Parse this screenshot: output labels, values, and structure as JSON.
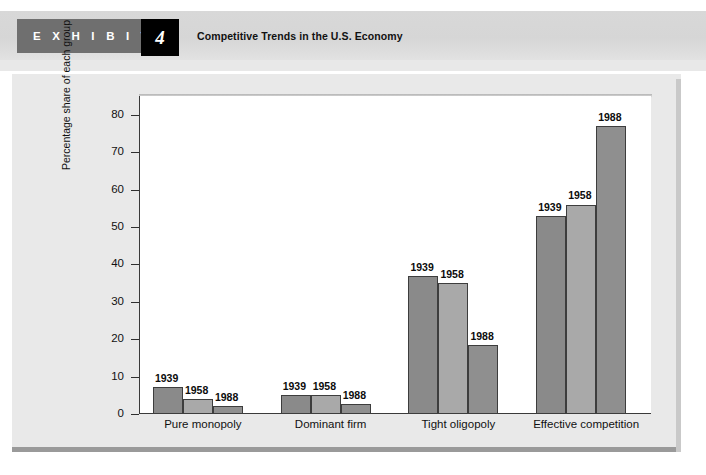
{
  "exhibit": {
    "kicker": "E X H I B I T",
    "number": "4",
    "title": "Competitive Trends in the U.S. Economy"
  },
  "colors": {
    "bar_1939": "#8a8a8a",
    "bar_1958": "#a9a9a9",
    "bar_1988": "#8f8f8f",
    "bar_border": "#3d3d3d",
    "panel_bg": "#e9e9e9",
    "plot_bg": "#ffffff",
    "axis": "#2f2f2f",
    "header_band": "#d6d6d6",
    "exhibit_tab": "#6f6f6f",
    "exhibit_num_bg": "#000000"
  },
  "chart_data": {
    "type": "bar",
    "title": "Competitive Trends in the U.S. Economy",
    "xlabel": "",
    "ylabel": "Percentage share of each group",
    "ylim": [
      0,
      85
    ],
    "yticks": [
      0,
      10,
      20,
      30,
      40,
      50,
      60,
      70,
      80
    ],
    "ytick_labels": [
      "0",
      "10",
      "20",
      "30",
      "40",
      "50",
      "60",
      "70",
      "80"
    ],
    "grid": false,
    "legend": "none",
    "data_labels": true,
    "categories": [
      "Pure monopoly",
      "Dominant firm",
      "Tight oligopoly",
      "Effective competition"
    ],
    "series": [
      {
        "name": "1939",
        "values": [
          7.3,
          5.2,
          37.0,
          52.8
        ]
      },
      {
        "name": "1958",
        "values": [
          4.0,
          5.2,
          35.0,
          56.0
        ]
      },
      {
        "name": "1988",
        "values": [
          2.2,
          2.8,
          18.5,
          77.0
        ]
      }
    ]
  }
}
